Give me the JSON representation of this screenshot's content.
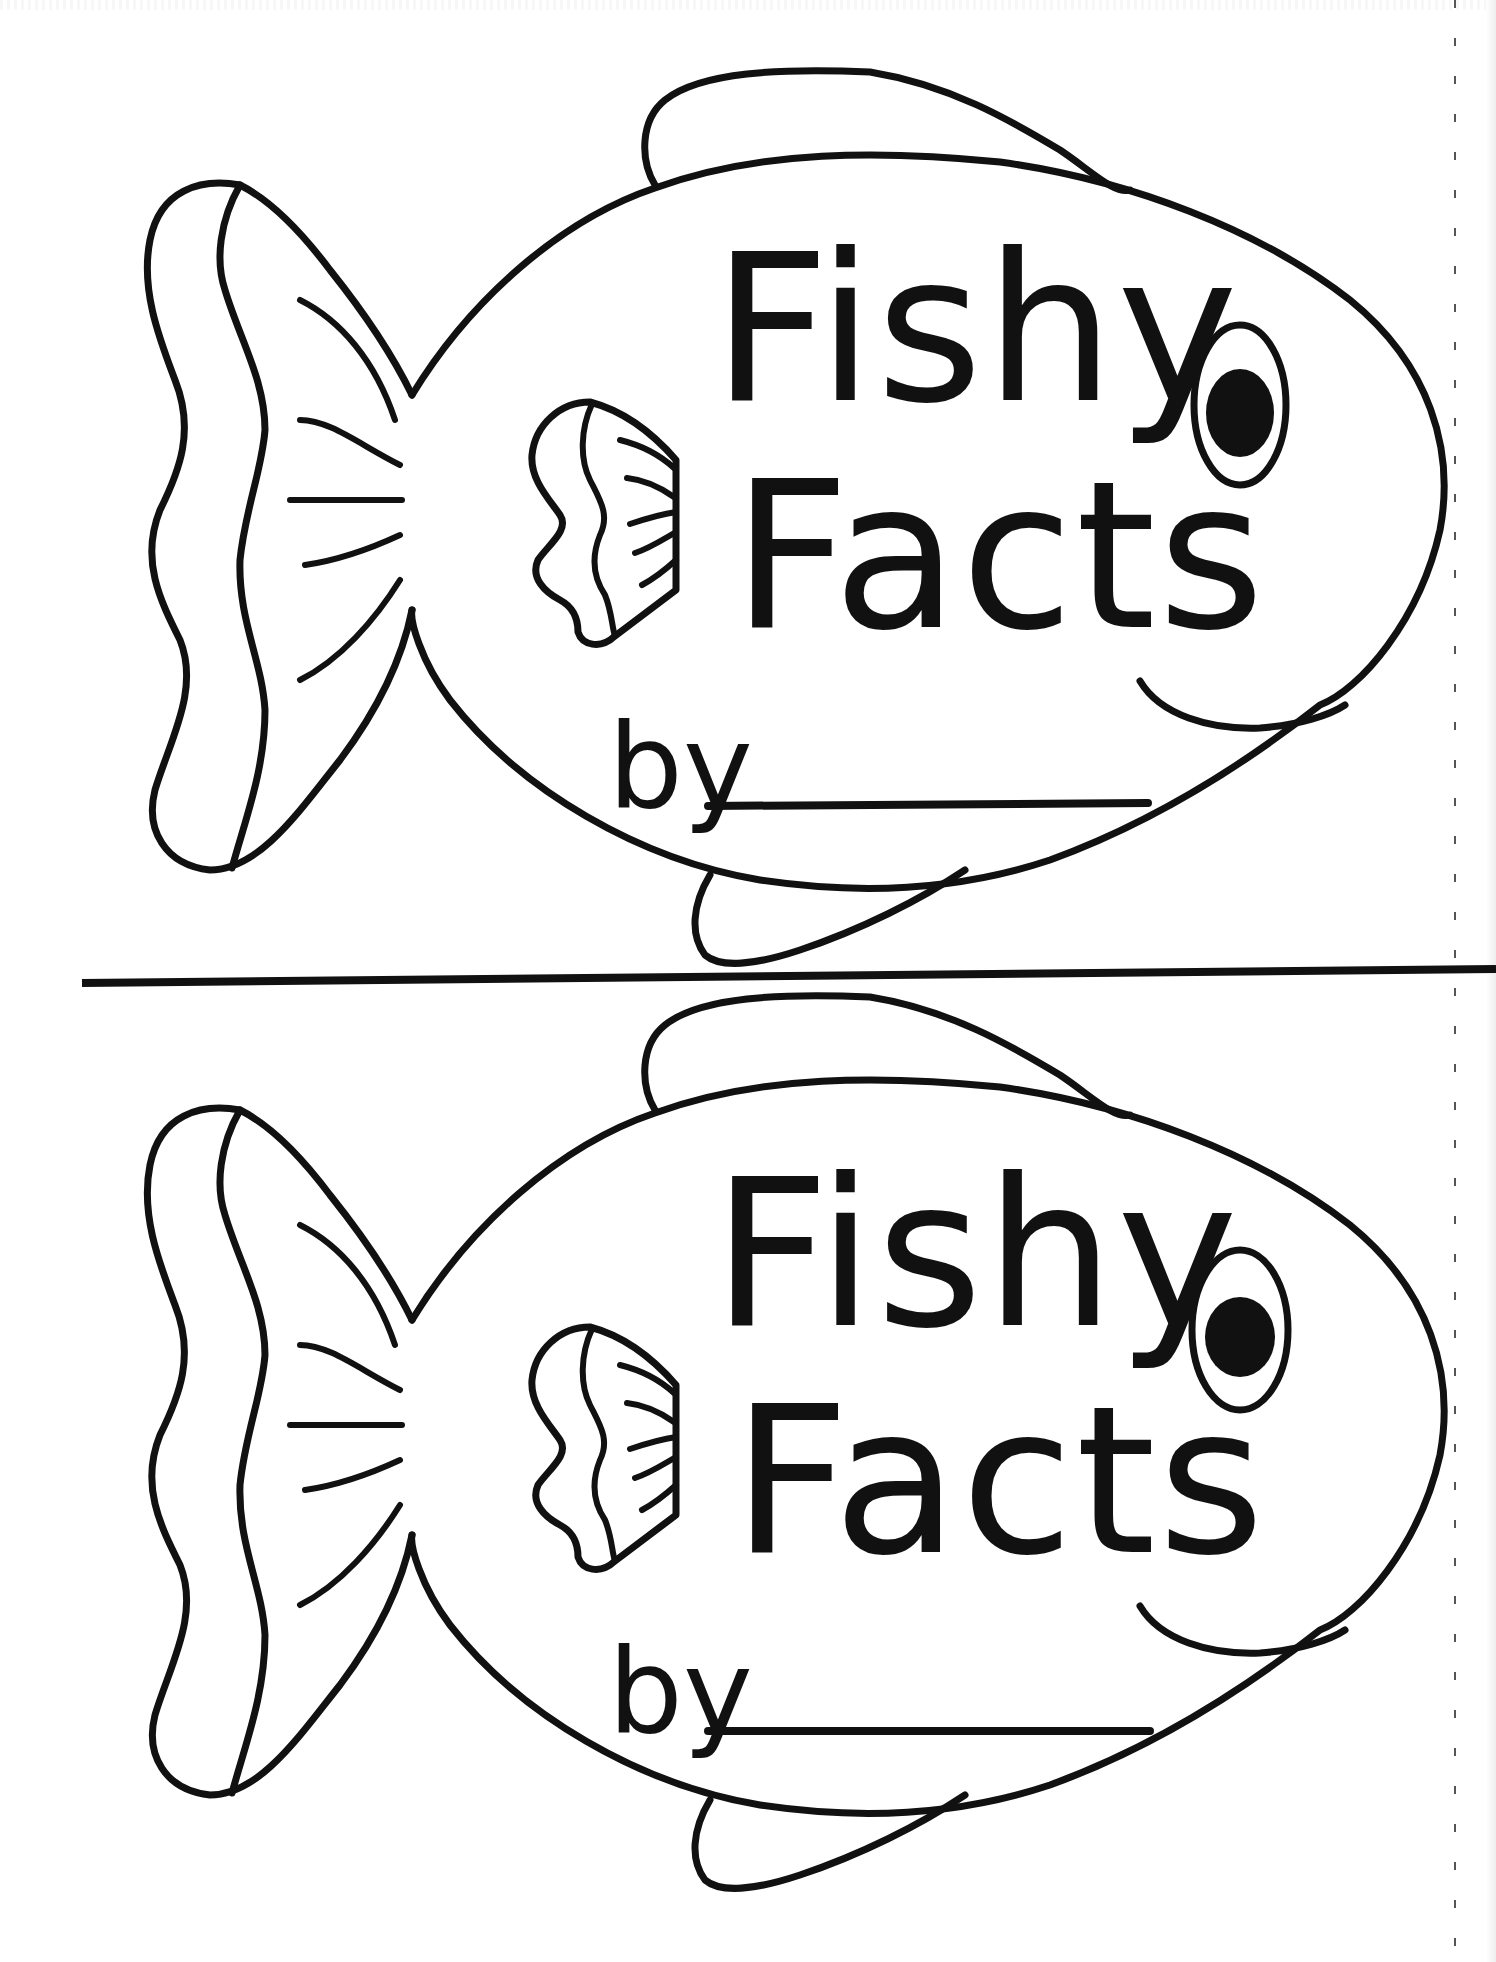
{
  "worksheet": {
    "kind": "printable coloring booklet cover (two copies per page)",
    "colors": {
      "ink": "#111111",
      "paper": "#ffffff"
    },
    "divider": {
      "description": "horizontal cut line between the two covers"
    },
    "covers": [
      {
        "title_line_1": "Fishy",
        "title_line_2": "Facts",
        "byline_label": "by",
        "name_field_value": "",
        "illustration": "cartoon fish outline with tail, dorsal fin, pectoral fin, bottom fin, eye and smiling mouth"
      },
      {
        "title_line_1": "Fishy",
        "title_line_2": "Facts",
        "byline_label": "by",
        "name_field_value": "",
        "illustration": "cartoon fish outline with tail, dorsal fin, pectoral fin, bottom fin, eye and smiling mouth"
      }
    ]
  }
}
